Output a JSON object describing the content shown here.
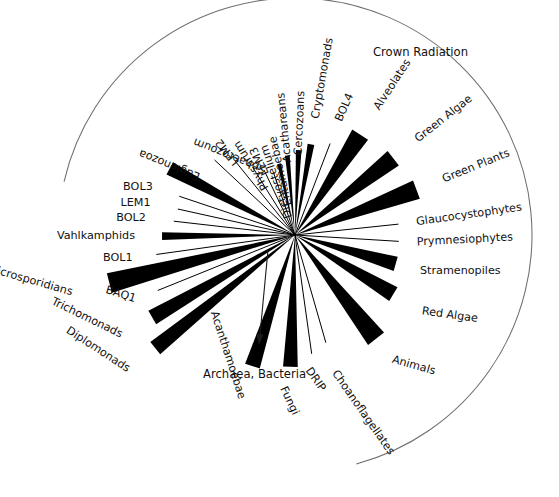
{
  "figure": {
    "type": "unrooted-phylogenetic-tree",
    "background_color": "#ffffff",
    "ink_color": "#000000",
    "arc_color": "#6d6d6d",
    "center": {
      "x": 295,
      "y": 235
    }
  },
  "annotations": {
    "crown_radiation": {
      "label": "Crown Radiation",
      "x": 373,
      "y": 52,
      "rotation": 0
    },
    "outgroup": {
      "label": "Archaea, Bacteria",
      "x": 203,
      "y": 374,
      "rotation": 0,
      "arrow_from": {
        "x": 268,
        "y": 250
      },
      "arrow_to": {
        "x": 259,
        "y": 345
      }
    },
    "crown_arc": {
      "radius": 237,
      "start_angle_deg": 193,
      "end_angle_deg": 75
    }
  },
  "taxa": [
    {
      "label": "Crypotomonads_placeholder",
      "hidden": true
    }
  ],
  "branches": [
    {
      "name": "cryptomonads",
      "label": "Cryptomonads",
      "angle": -80.0,
      "length": 92,
      "half_width_deg": 2.1,
      "style": "wedge",
      "label_radius": 118,
      "label_rotation": -80.0
    },
    {
      "name": "cercozoans",
      "label": "Cercozoans",
      "angle": -87.5,
      "length": 85,
      "half_width_deg": 1.9,
      "style": "wedge",
      "label_radius": 112,
      "label_rotation": -87.5
    },
    {
      "name": "acathareans",
      "label": "Acathareans",
      "angle": -95.5,
      "length": 80,
      "half_width_deg": 1.7,
      "style": "wedge",
      "label_radius": 108,
      "label_rotation": -95.5
    },
    {
      "name": "entamoebae",
      "label": "Entamoebae",
      "angle": -102.5,
      "length": 73,
      "half_width_deg": 1.5,
      "style": "wedge",
      "label_radius": 101,
      "label_rotation": -102.5
    },
    {
      "name": "dictyostelium",
      "label": "Dictyostelium",
      "angle": -109.0,
      "length": 66,
      "half_width_deg": 0.6,
      "style": "line",
      "label_radius": 95,
      "label_rotation": -109.0
    },
    {
      "name": "lem3",
      "label": "LEM3",
      "angle": -115.5,
      "length": 72,
      "half_width_deg": 0.6,
      "style": "line",
      "label_radius": 97,
      "label_rotation": -115.5
    },
    {
      "name": "physarum",
      "label": "Physarum",
      "angle": -122.0,
      "length": 80,
      "half_width_deg": 0.6,
      "style": "line",
      "label_radius": 110,
      "label_rotation": -122.0
    },
    {
      "name": "lem2",
      "label": "LEM2",
      "angle": -129.0,
      "length": 95,
      "half_width_deg": 0.6,
      "style": "line",
      "label_radius": 122,
      "label_rotation": -129.0
    },
    {
      "name": "sphaerozoum",
      "label": "Sphaerozoum",
      "angle": -137.0,
      "length": 110,
      "half_width_deg": 0.6,
      "style": "line",
      "label_radius": 138,
      "label_rotation": -158.0
    },
    {
      "name": "euglenozoa",
      "label": "Euglenozoa",
      "angle": -152.0,
      "length": 142,
      "half_width_deg": 2.8,
      "style": "wedge",
      "label_radius": 176,
      "label_rotation": -158.0
    },
    {
      "name": "bol3",
      "label": "BOL3",
      "angle": -161.5,
      "length": 122,
      "half_width_deg": 0.6,
      "style": "line",
      "label_radius": 150,
      "label_rotation": 0
    },
    {
      "name": "lem1",
      "label": "LEM1",
      "angle": -167.5,
      "length": 120,
      "half_width_deg": 0.6,
      "style": "line",
      "label_radius": 148,
      "label_rotation": 0
    },
    {
      "name": "bol2",
      "label": "BOL2",
      "angle": -173.5,
      "length": 122,
      "half_width_deg": 0.6,
      "style": "line",
      "label_radius": 150,
      "label_rotation": 0
    },
    {
      "name": "vahlkamphids",
      "label": "Vahlkamphids",
      "angle": 179.5,
      "length": 133,
      "half_width_deg": 1.7,
      "style": "wedge",
      "label_radius": 160,
      "label_rotation": 0
    },
    {
      "name": "bol1",
      "label": "BOL1",
      "angle": 172.0,
      "length": 140,
      "half_width_deg": 0.6,
      "style": "line",
      "label_radius": 164,
      "label_rotation": 0
    },
    {
      "name": "microsporidians",
      "label": "Microsporidians",
      "angle": 165.5,
      "length": 192,
      "half_width_deg": 3.0,
      "style": "wedge",
      "label_radius": 230,
      "label_rotation": 16.0
    },
    {
      "name": "baq1",
      "label": "BAQ1",
      "angle": 158.0,
      "length": 148,
      "half_width_deg": 0.6,
      "style": "line",
      "label_radius": 172,
      "label_rotation": 18.0
    },
    {
      "name": "trichomonads",
      "label": "Trichomonads",
      "angle": 150.0,
      "length": 165,
      "half_width_deg": 2.7,
      "style": "wedge",
      "label_radius": 200,
      "label_rotation": 26.0
    },
    {
      "name": "diplomonads",
      "label": "Diplomonads",
      "angle": 141.0,
      "length": 180,
      "half_width_deg": 2.5,
      "style": "wedge",
      "label_radius": 214,
      "label_rotation": 33.0
    },
    {
      "name": "acanthamoebae",
      "label": "Acanthamoebae",
      "angle": 108.0,
      "length": 138,
      "half_width_deg": 3.2,
      "style": "wedge",
      "label_radius": 172,
      "label_rotation": 72.0
    },
    {
      "name": "fungi",
      "label": "Fungi",
      "angle": 92.0,
      "length": 132,
      "half_width_deg": 3.2,
      "style": "wedge",
      "label_radius": 166,
      "label_rotation": 65.0
    },
    {
      "name": "drip",
      "label": "DRIP",
      "angle": 82.0,
      "length": 120,
      "half_width_deg": 0.6,
      "style": "line",
      "label_radius": 146,
      "label_rotation": 55.0
    },
    {
      "name": "choanoflagellates",
      "label": "Choanoflagellates",
      "angle": 74.0,
      "length": 112,
      "half_width_deg": 0.6,
      "style": "line",
      "label_radius": 142,
      "label_rotation": 55.0
    },
    {
      "name": "animals",
      "label": "Animals",
      "angle": 52.0,
      "length": 132,
      "half_width_deg": 4.4,
      "style": "wedge",
      "label_radius": 158,
      "label_rotation": 16.0
    },
    {
      "name": "red-algae",
      "label": "Red Algae",
      "angle": 31.0,
      "length": 115,
      "half_width_deg": 4.0,
      "style": "wedge",
      "label_radius": 148,
      "label_rotation": 8.0
    },
    {
      "name": "stramenopiles",
      "label": "Stramenopiles",
      "angle": 16.0,
      "length": 105,
      "half_width_deg": 4.0,
      "style": "wedge",
      "label_radius": 130,
      "label_rotation": 0
    },
    {
      "name": "prymnesiophytes",
      "label": "Prymnesiophytes",
      "angle": 3.5,
      "length": 104,
      "half_width_deg": 0.6,
      "style": "line",
      "label_radius": 122,
      "label_rotation": -3.0
    },
    {
      "name": "glaucocystophytes",
      "label": "Glaucocystophytes",
      "angle": -6.0,
      "length": 104,
      "half_width_deg": 0.6,
      "style": "line",
      "label_radius": 122,
      "label_rotation": -8.0
    },
    {
      "name": "green-plants",
      "label": "Green Plants",
      "angle": -20.5,
      "length": 130,
      "half_width_deg": 4.3,
      "style": "wedge",
      "label_radius": 158,
      "label_rotation": -22.0
    },
    {
      "name": "green-algae",
      "label": "Green Algae",
      "angle": -38.0,
      "length": 125,
      "half_width_deg": 4.2,
      "style": "wedge",
      "label_radius": 154,
      "label_rotation": -38.0
    },
    {
      "name": "alveolates",
      "label": "Alveolates",
      "angle": -57.0,
      "length": 120,
      "half_width_deg": 4.5,
      "style": "wedge",
      "label_radius": 150,
      "label_rotation": -57.0
    },
    {
      "name": "bol4",
      "label": "BOL4",
      "angle": -69.0,
      "length": 98,
      "half_width_deg": 0.6,
      "style": "line",
      "label_radius": 122,
      "label_rotation": -66.0
    }
  ]
}
